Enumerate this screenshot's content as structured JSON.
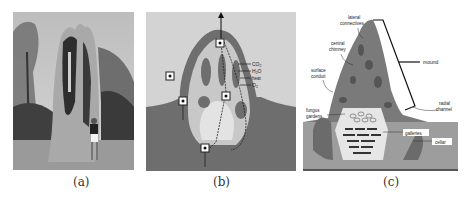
{
  "figure": {
    "panels": [
      {
        "id": "a",
        "caption": "(a)",
        "content": "photograph of cathedral termite mound with person standing beside it"
      },
      {
        "id": "b",
        "caption": "(b)",
        "content": "cross-section schematic of mound ventilation flows",
        "labels": {
          "co2": "CO",
          "co2_sub": "2",
          "h2o": "H",
          "h2o_sub": "2",
          "h2o_end": "O",
          "heat": "heat",
          "o2": "O",
          "o2_sub": "2"
        }
      },
      {
        "id": "c",
        "caption": "(c)",
        "content": "annotated cutaway of mound structure",
        "labels": {
          "lateral_1": "lateral",
          "lateral_2": "connectives",
          "central_1": "central",
          "central_2": "chimney",
          "surface_1": "surface",
          "surface_2": "conduit",
          "fungus_1": "fungus",
          "fungus_2": "gardens",
          "mound": "mound",
          "radial_1": "radial",
          "radial_2": "channel",
          "galleries": "galleries",
          "cellar": "cellar"
        }
      }
    ]
  }
}
